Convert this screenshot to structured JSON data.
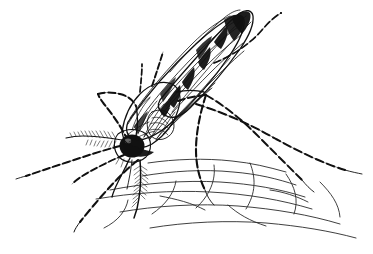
{
  "figure": {
    "title": "Mosquito feeding on skin",
    "subject": "mosquito",
    "style": "pen-and-ink line drawing",
    "medium": "black ink on white",
    "width": 373,
    "height": 254,
    "background_color": "#ffffff",
    "ink_color": "#111111",
    "skin_line_color": "#2a2a2a"
  },
  "anatomy": {
    "eye": {
      "label": "compound eye",
      "color": "#111111"
    },
    "proboscis": {
      "label": "proboscis"
    },
    "palps": {
      "label": "maxillary palps"
    },
    "antenna": {
      "label": "plumose antenna"
    },
    "head": {
      "label": "head"
    },
    "thorax": {
      "label": "thorax"
    },
    "abdomen": {
      "label": "banded abdomen"
    },
    "wing": {
      "label": "striated wing"
    },
    "legs": {
      "label": "banded legs"
    },
    "substrate": {
      "label": "skin surface"
    }
  },
  "elements": {
    "abdomen_bands": 7,
    "wing_veins": 9,
    "leg_count": 6,
    "skin_lines": 12
  }
}
